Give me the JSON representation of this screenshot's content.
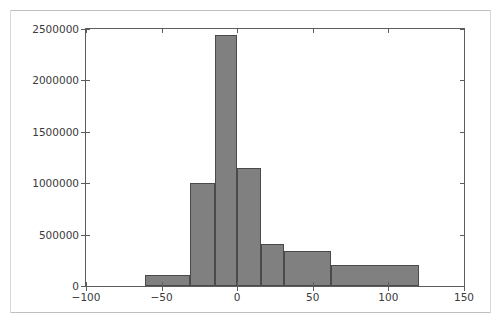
{
  "figure": {
    "background_color": "#ffffff",
    "axes_color": "#5c5c5c",
    "tick_label_color": "#3a3a3a",
    "rule_color": "#bfbfbf"
  },
  "chart_data": {
    "type": "bar",
    "title": "",
    "subtitle": "",
    "xlabel": "",
    "ylabel": "",
    "grid": false,
    "legend": null,
    "xlim": [
      -100,
      150
    ],
    "ylim": [
      0,
      2500000
    ],
    "xticks": [
      -100,
      -50,
      0,
      50,
      100,
      150
    ],
    "xtick_labels": [
      "−100",
      "−50",
      "0",
      "50",
      "100",
      "150"
    ],
    "yticks": [
      0,
      500000,
      1000000,
      1500000,
      2000000,
      2500000
    ],
    "ytick_labels": [
      "0",
      "500000",
      "1000000",
      "1500000",
      "2000000",
      "2500000"
    ],
    "bar_color": "#808080",
    "bar_edge_color": "#4a4a4a",
    "bins": [
      {
        "label": "bin-1",
        "x_start": -61,
        "x_end": -31,
        "value": 110000
      },
      {
        "label": "bin-2",
        "x_start": -31,
        "x_end": -15,
        "value": 1000000
      },
      {
        "label": "bin-3",
        "x_start": -15,
        "x_end": 0,
        "value": 2440000
      },
      {
        "label": "bin-4",
        "x_start": 0,
        "x_end": 16,
        "value": 1150000
      },
      {
        "label": "bin-5",
        "x_start": 16,
        "x_end": 31,
        "value": 410000
      },
      {
        "label": "bin-6",
        "x_start": 31,
        "x_end": 62,
        "value": 340000
      },
      {
        "label": "bin-7",
        "x_start": 62,
        "x_end": 120,
        "value": 205000
      }
    ]
  }
}
